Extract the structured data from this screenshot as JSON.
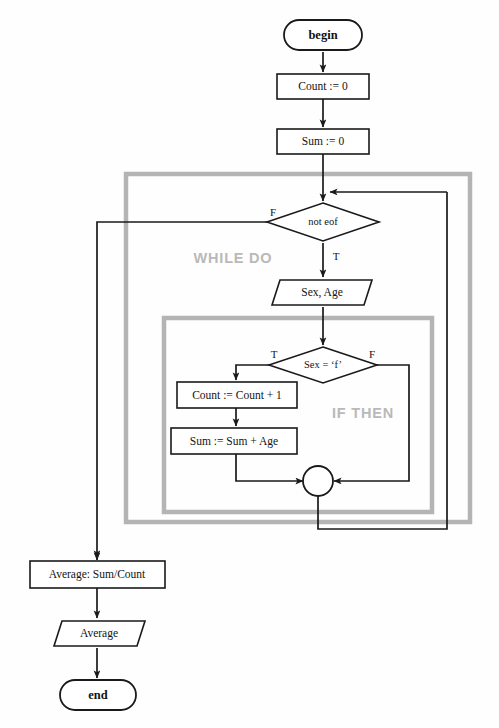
{
  "diagram": {
    "colors": {
      "line": "#1a1a1a",
      "group_frame": "#b4b4b4",
      "group_label": "#b9b9b9",
      "node_fill": "#ffffff",
      "background": "#fefefe"
    },
    "groups": [
      {
        "id": "while-do",
        "label": "WHILE DO"
      },
      {
        "id": "if-then",
        "label": "IF THEN"
      }
    ],
    "nodes": [
      {
        "id": "begin",
        "type": "terminal",
        "label": "begin"
      },
      {
        "id": "count-init",
        "type": "process",
        "label": "Count := 0"
      },
      {
        "id": "sum-init",
        "type": "process",
        "label": "Sum := 0"
      },
      {
        "id": "not-eof",
        "type": "decision",
        "label": "not eof"
      },
      {
        "id": "read-sex-age",
        "type": "io",
        "label": "Sex, Age"
      },
      {
        "id": "sex-is-f",
        "type": "decision",
        "label": "Sex = ‘f’"
      },
      {
        "id": "count-incr",
        "type": "process",
        "label": "Count := Count + 1"
      },
      {
        "id": "sum-accum",
        "type": "process",
        "label": "Sum := Sum + Age"
      },
      {
        "id": "merge",
        "type": "connector",
        "label": ""
      },
      {
        "id": "average-calc",
        "type": "process",
        "label": "Average: Sum/Count"
      },
      {
        "id": "average-out",
        "type": "io",
        "label": "Average"
      },
      {
        "id": "end",
        "type": "terminal",
        "label": "end"
      }
    ],
    "branch_labels": {
      "not_eof_false": "F",
      "not_eof_true": "T",
      "sex_true": "T",
      "sex_false": "F"
    }
  }
}
